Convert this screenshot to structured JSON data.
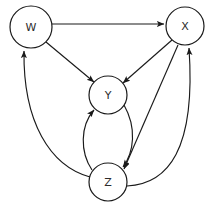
{
  "diagram": {
    "type": "directed-graph",
    "title": "",
    "background_color": "#ffffff",
    "node_fill": "#ffffff",
    "node_stroke": "#1a1a1a",
    "edge_color": "#1a1a1a",
    "nodes": [
      {
        "id": "W",
        "label": "W",
        "cx": 31,
        "cy": 27,
        "r": 21
      },
      {
        "id": "X",
        "label": "X",
        "cx": 185,
        "cy": 26,
        "r": 19
      },
      {
        "id": "Y",
        "label": "Y",
        "cx": 108,
        "cy": 95,
        "r": 19
      },
      {
        "id": "Z",
        "label": "Z",
        "cx": 108,
        "cy": 182,
        "r": 19
      }
    ],
    "edges": [
      {
        "from": "W",
        "to": "X",
        "style": "straight",
        "directed": true
      },
      {
        "from": "W",
        "to": "Y",
        "style": "straight",
        "directed": true
      },
      {
        "from": "X",
        "to": "Y",
        "style": "straight",
        "directed": true
      },
      {
        "from": "X",
        "to": "Z",
        "style": "straight",
        "directed": true
      },
      {
        "from": "Y",
        "to": "Z",
        "style": "curve-right",
        "directed": true
      },
      {
        "from": "Z",
        "to": "Y",
        "style": "curve-left",
        "directed": true
      },
      {
        "from": "Z",
        "to": "X",
        "style": "curve-outer-right",
        "directed": true
      },
      {
        "from": "Z",
        "to": "W",
        "style": "curve-outer-left",
        "directed": true
      }
    ]
  }
}
